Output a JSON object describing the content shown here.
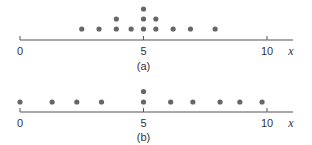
{
  "chart_data": [
    {
      "type": "scatter",
      "subtype": "dot-plot",
      "caption": "(a)",
      "xlabel": "x",
      "xlim": [
        0,
        11
      ],
      "ticks": [
        0,
        5,
        10
      ],
      "tick_labels": [
        "0",
        "5",
        "10"
      ],
      "grid": false,
      "points": [
        {
          "x": 2.5,
          "count": 1
        },
        {
          "x": 3.2,
          "count": 1
        },
        {
          "x": 3.9,
          "count": 2
        },
        {
          "x": 4.5,
          "count": 1
        },
        {
          "x": 5.0,
          "count": 3
        },
        {
          "x": 5.5,
          "count": 2
        },
        {
          "x": 6.2,
          "count": 1
        },
        {
          "x": 6.9,
          "count": 1
        },
        {
          "x": 7.9,
          "count": 1
        }
      ]
    },
    {
      "type": "scatter",
      "subtype": "dot-plot",
      "caption": "(b)",
      "xlabel": "x",
      "xlim": [
        0,
        11
      ],
      "ticks": [
        0,
        5,
        10
      ],
      "tick_labels": [
        "0",
        "5",
        "10"
      ],
      "grid": false,
      "points": [
        {
          "x": 0.0,
          "count": 1
        },
        {
          "x": 1.3,
          "count": 1
        },
        {
          "x": 2.3,
          "count": 1
        },
        {
          "x": 3.3,
          "count": 1
        },
        {
          "x": 5.0,
          "count": 2
        },
        {
          "x": 6.1,
          "count": 1
        },
        {
          "x": 7.0,
          "count": 1
        },
        {
          "x": 8.1,
          "count": 1
        },
        {
          "x": 8.9,
          "count": 1
        },
        {
          "x": 9.8,
          "count": 1
        }
      ]
    }
  ],
  "style": {
    "dot_color": "#666666",
    "axis_color": "#555555"
  }
}
